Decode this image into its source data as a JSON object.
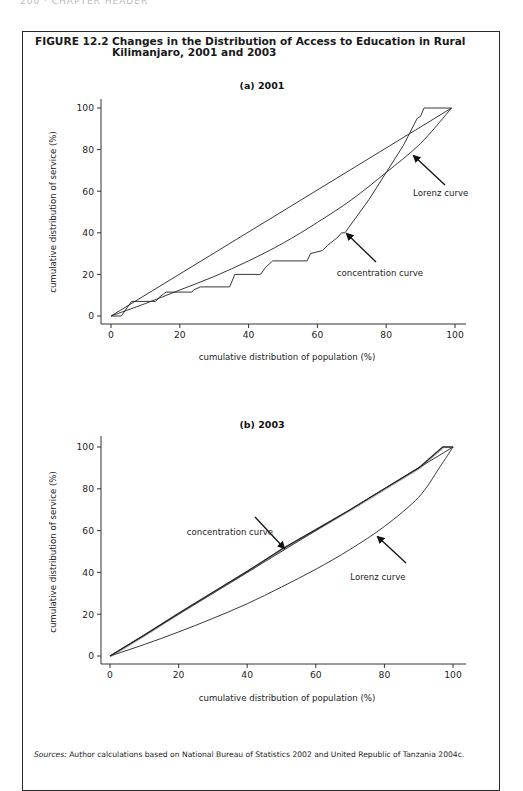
{
  "page": {
    "running_head": "200 · CHAPTER HEADER"
  },
  "figure": {
    "number": "FIGURE 12.2",
    "title": "Changes in the Distribution of Access to Education in Rural Kilimanjaro, 2001 and 2003",
    "sources_label": "Sources:",
    "sources_text": " Author calculations based on National Bureau of Statistics 2002 and United Republic of Tanzania 2004c."
  },
  "chart_data": [
    {
      "type": "line",
      "title": "(a) 2001",
      "xlabel": "cumulative distribution of population (%)",
      "ylabel": "cumulative distribution of service (%)",
      "xlim": [
        0,
        100
      ],
      "ylim": [
        0,
        100
      ],
      "xticks": [
        0,
        20,
        40,
        60,
        80,
        100
      ],
      "yticks": [
        0,
        20,
        40,
        60,
        80,
        100
      ],
      "grid": false,
      "legend": "none (annotated with arrows)",
      "series": [
        {
          "name": "line of equality",
          "x": [
            0,
            99
          ],
          "y": [
            0,
            100
          ]
        },
        {
          "name": "Lorenz curve",
          "x": [
            0,
            10,
            20,
            30,
            40,
            50,
            60,
            70,
            80,
            90,
            99
          ],
          "y": [
            0,
            6,
            12.5,
            19,
            26.5,
            35,
            45,
            56,
            69,
            83,
            100
          ]
        },
        {
          "name": "concentration curve",
          "x": [
            0,
            3,
            6,
            13,
            14,
            16,
            23.5,
            24,
            26,
            34.5,
            36,
            43.5,
            45,
            47,
            57,
            58,
            61.5,
            63,
            66,
            67,
            68,
            75,
            80,
            85,
            89,
            90,
            91,
            92,
            99
          ],
          "y": [
            0,
            0,
            7,
            7,
            9,
            11.5,
            11.5,
            12.5,
            14,
            14,
            20,
            20,
            23.5,
            26.5,
            26.5,
            30,
            31.5,
            34,
            38,
            40,
            40,
            56,
            69,
            82,
            95,
            96,
            100,
            100,
            100
          ]
        }
      ],
      "annotations": [
        {
          "text": "Lorenz curve",
          "arrow_to": [
            88,
            77
          ]
        },
        {
          "text": "concentration curve",
          "arrow_to": [
            68,
            40
          ]
        }
      ]
    },
    {
      "type": "line",
      "title": "(b) 2003",
      "xlabel": "cumulative distribution of population (%)",
      "ylabel": "cumulative distribution of service (%)",
      "xlim": [
        0,
        100
      ],
      "ylim": [
        0,
        100
      ],
      "xticks": [
        0,
        20,
        40,
        60,
        80,
        100
      ],
      "yticks": [
        0,
        20,
        40,
        60,
        80,
        100
      ],
      "grid": false,
      "legend": "none (annotated with arrows)",
      "series": [
        {
          "name": "line of equality",
          "x": [
            0,
            100
          ],
          "y": [
            0,
            100
          ]
        },
        {
          "name": "Lorenz curve",
          "x": [
            0,
            10,
            20,
            30,
            40,
            50,
            60,
            70,
            80,
            90,
            96,
            100
          ],
          "y": [
            0,
            5.5,
            11.5,
            18,
            25,
            33,
            41.5,
            51,
            62,
            76,
            90,
            100
          ]
        },
        {
          "name": "concentration curve",
          "x": [
            0,
            10,
            20,
            30,
            40,
            50,
            60,
            70,
            80,
            90,
            97,
            100
          ],
          "y": [
            0,
            10,
            20.5,
            30.5,
            40.5,
            51,
            60.5,
            70,
            80,
            90,
            100,
            100
          ]
        }
      ],
      "annotations": [
        {
          "text": "concentration curve",
          "arrow_to": [
            51,
            51
          ]
        },
        {
          "text": "Lorenz curve",
          "arrow_to": [
            77,
            58
          ]
        }
      ]
    }
  ],
  "plots": [
    {
      "origin_px": [
        111,
        316
      ],
      "x100_px": 455,
      "y100_px": 108,
      "axis_top_px": 99,
      "axis_left_px": 101,
      "axis_bottom_px": 324,
      "axis_right_px": 466,
      "title_pos": [
        262,
        89
      ],
      "xlabel_pos": [
        287,
        360
      ],
      "ylabel_pos": [
        56,
        212
      ],
      "annotation_px": [
        {
          "label_pos": [
            413,
            196
          ],
          "anchor": "start",
          "arrow_from": [
            445,
            185
          ],
          "arrow_to": [
            414,
            156
          ]
        },
        {
          "label_pos": [
            380,
            276
          ],
          "anchor": "middle",
          "arrow_from": [
            376,
            262
          ],
          "arrow_to": [
            347,
            234
          ]
        }
      ]
    },
    {
      "origin_px": [
        110,
        656
      ],
      "x100_px": 453,
      "y100_px": 447,
      "axis_top_px": 436,
      "axis_left_px": 101,
      "axis_bottom_px": 664,
      "axis_right_px": 466,
      "title_pos": [
        262,
        428
      ],
      "xlabel_pos": [
        287,
        701
      ],
      "ylabel_pos": [
        56,
        552
      ],
      "annotation_px": [
        {
          "label_pos": [
            230,
            535
          ],
          "anchor": "middle",
          "arrow_from": [
            255,
            517
          ],
          "arrow_to": [
            284,
            548
          ]
        },
        {
          "label_pos": [
            378,
            580
          ],
          "anchor": "middle",
          "arrow_from": [
            406,
            563
          ],
          "arrow_to": [
            378,
            537
          ]
        }
      ]
    }
  ]
}
